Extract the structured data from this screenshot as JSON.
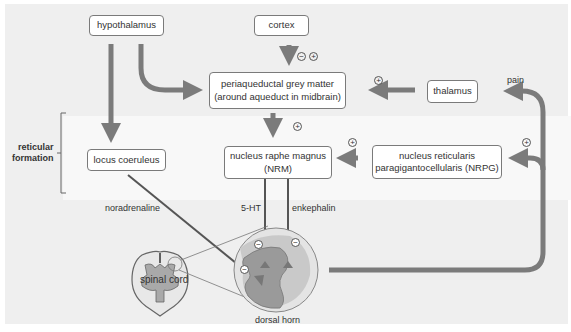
{
  "boxes": {
    "hypothalamus": "hypothalamus",
    "cortex": "cortex",
    "pag_line1": "periaqueductal grey matter",
    "pag_line2": "(around aqueduct in midbrain)",
    "thalamus": "thalamus",
    "locus": "locus coeruleus",
    "nrm_line1": "nucleus raphe magnus",
    "nrm_line2": "(NRM)",
    "nrpg_line1": "nucleus reticularis",
    "nrpg_line2": "paragigantocellularis (NRPG)"
  },
  "labels": {
    "reticular_line1": "reticular",
    "reticular_line2": "formation",
    "noradrenaline": "noradrenaline",
    "serotonin": "5-HT",
    "enkephalin": "enkephalin",
    "pain": "pain",
    "spinal_cord": "spinal cord",
    "dorsal_horn": "dorsal horn"
  },
  "signs": {
    "plus": "+",
    "minus": "−"
  },
  "colors": {
    "arrow": "#7b7b7b",
    "background": "#efefef",
    "band": "#f8f8f8",
    "dorsal_horn_dark": "#9a9a9a",
    "dorsal_horn_light": "#c9c9c9"
  }
}
